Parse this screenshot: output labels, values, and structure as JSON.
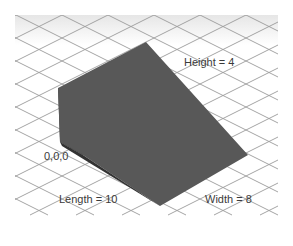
{
  "diagram": {
    "type": "3d-wedge-on-isometric-grid",
    "colors": {
      "background": "#ffffff",
      "grid_line": "#9a9a9a",
      "top_band": "#ececec",
      "slope_face": "#5a5a5a",
      "side_face": "#3e3e3e",
      "edge_face": "#2e2e2e"
    },
    "labels": {
      "height": "Height = 4",
      "length": "Length = 10",
      "width": "Width = 8",
      "origin": "0,0,0"
    },
    "dimensions": {
      "height": 4,
      "length": 10,
      "width": 8,
      "origin": [
        0,
        0,
        0
      ]
    }
  }
}
